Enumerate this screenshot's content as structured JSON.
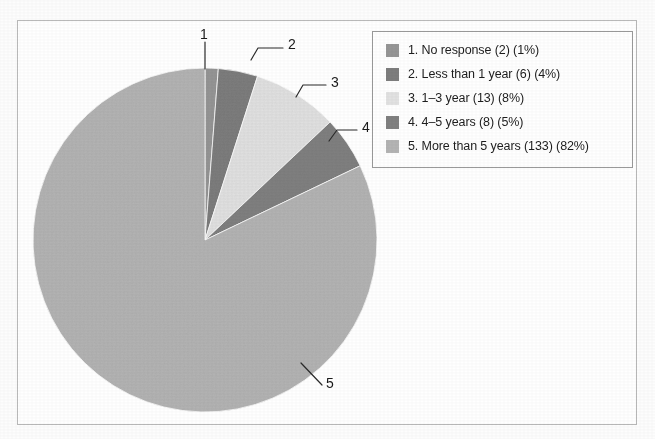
{
  "chart_data": {
    "type": "pie",
    "title": "",
    "subtitle": "",
    "xlabel": "",
    "ylabel": "",
    "legend_position": "right",
    "grid": false,
    "total_responses": 162,
    "categories": [
      "1. No response",
      "2. Less than 1 year",
      "3. 1–3 year",
      "4. 4–5 years",
      "5. More than 5 years"
    ],
    "values": [
      2,
      6,
      13,
      8,
      133
    ],
    "percentages": [
      1,
      4,
      8,
      5,
      82
    ],
    "colors": [
      "#969696",
      "#7d7d7d",
      "#e2e2e2",
      "#808080",
      "#b4b4b4"
    ],
    "start_angle_deg": 0,
    "direction": "clockwise",
    "slices": [
      {
        "index": "1",
        "label": "1. No response",
        "count": 2,
        "percent": 1,
        "color": "#969696",
        "callout": "1"
      },
      {
        "index": "2",
        "label": "2. Less than 1 year",
        "count": 6,
        "percent": 4,
        "color": "#7d7d7d",
        "callout": "2"
      },
      {
        "index": "3",
        "label": "3. 1–3 year",
        "count": 13,
        "percent": 8,
        "color": "#e2e2e2",
        "callout": "3"
      },
      {
        "index": "4",
        "label": "4. 4–5 years",
        "count": 8,
        "percent": 5,
        "color": "#808080",
        "callout": "4"
      },
      {
        "index": "5",
        "label": "5. More than 5 years",
        "count": 133,
        "percent": 82,
        "color": "#b4b4b4",
        "callout": "5"
      }
    ]
  },
  "legend": {
    "items": [
      {
        "swatch_color": "#969696",
        "text": "1. No response (2) (1%)"
      },
      {
        "swatch_color": "#7d7d7d",
        "text": "2. Less than 1 year (6) (4%)"
      },
      {
        "swatch_color": "#e2e2e2",
        "text": "3. 1–3 year (13) (8%)"
      },
      {
        "swatch_color": "#808080",
        "text": "4. 4–5 years (8) (5%)"
      },
      {
        "swatch_color": "#b4b4b4",
        "text": "5. More than 5 years (133) (82%)"
      }
    ]
  },
  "callouts": {
    "one": "1",
    "two": "2",
    "three": "3",
    "four": "4",
    "five": "5"
  },
  "style": {
    "frame_border_color": "#b9b9b9",
    "legend_border_color": "#9a9a9a",
    "text_color": "#1d1d1d",
    "leader_line_color": "#2a2a2a",
    "background": "#ffffff"
  }
}
